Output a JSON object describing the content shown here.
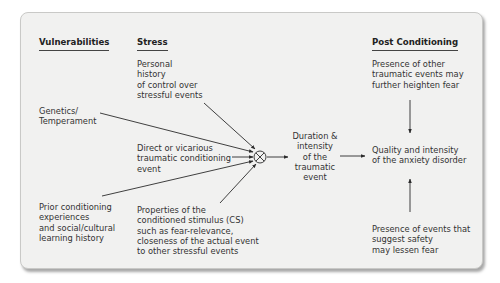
{
  "headers": {
    "vulnerabilities": "Vulnerabilities",
    "stress": "Stress",
    "post_conditioning": "Post Conditioning"
  },
  "vulnerabilities": {
    "genetics": [
      "Genetics/",
      "Temperament"
    ],
    "prior": [
      "Prior conditioning",
      "experiences",
      "and social/cultural",
      "learning history"
    ]
  },
  "stress": {
    "personal_history": [
      "Personal",
      "history",
      "of control over",
      "stressful events"
    ],
    "direct": [
      "Direct or vicarious",
      "traumatic conditioning",
      "event"
    ],
    "properties": [
      "Properties of the",
      "conditioned stimulus (CS)",
      "such as fear-relevance,",
      "closeness of the actual event",
      "to other stressful events"
    ]
  },
  "combiner": {
    "symbol": "⊗",
    "icon": "multiply-circle-icon"
  },
  "outcome": {
    "duration": [
      "Duration &",
      "intensity",
      "of the",
      "traumatic",
      "event"
    ],
    "quality": [
      "Quality and intensity",
      "of the anxiety disorder"
    ]
  },
  "post_conditioning": {
    "heighten": [
      "Presence of other",
      "traumatic events may",
      "further heighten fear"
    ],
    "lessen": [
      "Presence of events that",
      "suggest safety",
      "may lessen fear"
    ]
  },
  "colors": {
    "panel_bg": "#f1f1f0",
    "line": "#2b2b2b",
    "text": "#333333"
  }
}
